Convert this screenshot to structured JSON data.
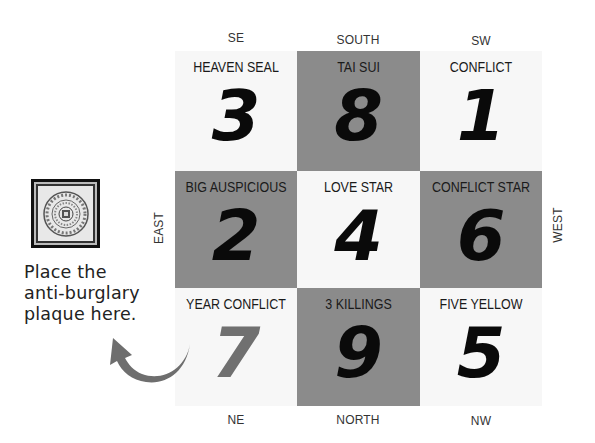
{
  "directions": {
    "se": "SE",
    "south": "SOUTH",
    "sw": "SW",
    "east": "EAST",
    "west": "WEST",
    "ne": "NE",
    "north": "NORTH",
    "nw": "NW"
  },
  "grid": {
    "cells": [
      {
        "label": "HEAVEN SEAL",
        "number": "3",
        "shade": "light"
      },
      {
        "label": "TAI SUI",
        "number": "8",
        "shade": "dark"
      },
      {
        "label": "CONFLICT",
        "number": "1",
        "shade": "light"
      },
      {
        "label": "BIG AUSPICIOUS",
        "number": "2",
        "shade": "dark"
      },
      {
        "label": "LOVE STAR",
        "number": "4",
        "shade": "light"
      },
      {
        "label": "CONFLICT STAR",
        "number": "6",
        "shade": "dark"
      },
      {
        "label": "YEAR CONFLICT",
        "number": "7",
        "shade": "light"
      },
      {
        "label": "3 KILLINGS",
        "number": "9",
        "shade": "dark"
      },
      {
        "label": "FIVE YELLOW",
        "number": "5",
        "shade": "light"
      }
    ]
  },
  "plaque": {
    "icon": "anti-burglary-plaque-icon",
    "caption": [
      "Place the",
      "anti-burglary",
      "plaque here."
    ]
  },
  "arrow": {
    "icon": "curved-arrow-icon",
    "color": "#6e6e6e"
  },
  "colors": {
    "dark_cell": "#8b8b8b",
    "light_cell": "#f7f7f7",
    "number": "#0a0a0a",
    "faded_number": "#707070"
  }
}
